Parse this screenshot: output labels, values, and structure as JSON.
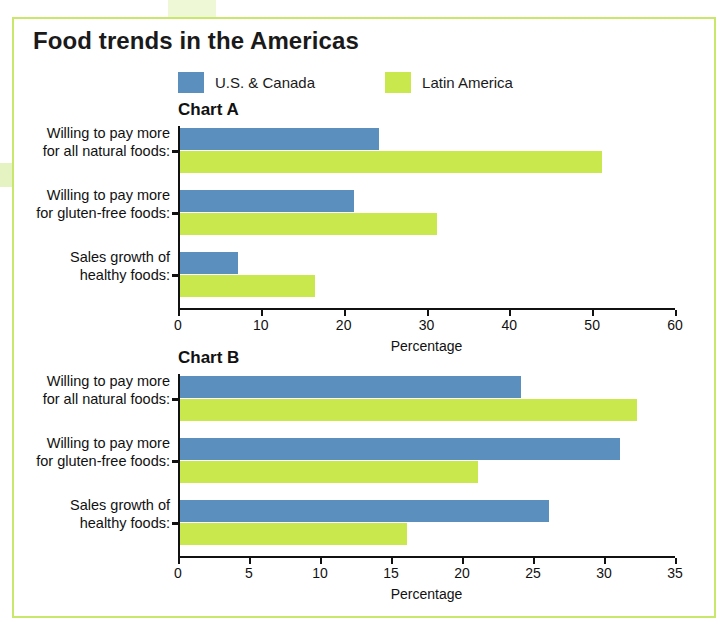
{
  "page": {
    "title": "Food trends in the Americas"
  },
  "legend": {
    "items": [
      {
        "label": "U.S. & Canada",
        "color": "#5B8FBE",
        "name": "legend-swatch-us-canada"
      },
      {
        "label": "Latin America",
        "color": "#C8E84D",
        "name": "legend-swatch-latin-america"
      }
    ]
  },
  "colors": {
    "series_blue": "#5B8FBE",
    "series_green": "#C8E84D",
    "panel_border": "#C9E86B",
    "axis": "#111111"
  },
  "chart_data": [
    {
      "id": "chart-a",
      "type": "bar",
      "orientation": "horizontal",
      "title": "Chart A",
      "xlabel": "Percentage",
      "ylabel": "",
      "xlim": [
        0,
        60
      ],
      "xticks": [
        0,
        10,
        20,
        30,
        40,
        50,
        60
      ],
      "xticklabels": [
        "0",
        "10",
        "20",
        "30",
        "40",
        "50",
        "60"
      ],
      "grid": false,
      "legend_position": "top",
      "categories": [
        "Willing to pay more\nfor all natural foods:",
        "Willing to pay more\nfor gluten-free foods:",
        "Sales growth of\nhealthy foods:"
      ],
      "category_lines": [
        [
          "Willing to pay more",
          "for all natural foods:"
        ],
        [
          "Willing to pay more",
          "for gluten-free foods:"
        ],
        [
          "Sales growth of",
          "healthy foods:"
        ]
      ],
      "series": [
        {
          "name": "U.S. & Canada",
          "color": "#5B8FBE",
          "values": [
            24,
            21,
            7
          ]
        },
        {
          "name": "Latin America",
          "color": "#C8E84D",
          "values": [
            51,
            31,
            16.3
          ]
        }
      ]
    },
    {
      "id": "chart-b",
      "type": "bar",
      "orientation": "horizontal",
      "title": "Chart B",
      "xlabel": "Percentage",
      "ylabel": "",
      "xlim": [
        0,
        35
      ],
      "xticks": [
        0,
        5,
        10,
        15,
        20,
        25,
        30,
        35
      ],
      "xticklabels": [
        "0",
        "5",
        "10",
        "15",
        "20",
        "25",
        "30",
        "35"
      ],
      "grid": false,
      "legend_position": "top",
      "categories": [
        "Willing to pay more\nfor all natural foods:",
        "Willing to pay more\nfor gluten-free foods:",
        "Sales growth of\nhealthy foods:"
      ],
      "category_lines": [
        [
          "Willing to pay more",
          "for all natural foods:"
        ],
        [
          "Willing to pay more",
          "for gluten-free foods:"
        ],
        [
          "Sales growth of",
          "healthy foods:"
        ]
      ],
      "series": [
        {
          "name": "U.S. & Canada",
          "color": "#5B8FBE",
          "values": [
            24,
            31,
            26
          ]
        },
        {
          "name": "Latin America",
          "color": "#C8E84D",
          "values": [
            32.2,
            21,
            16
          ]
        }
      ]
    }
  ]
}
